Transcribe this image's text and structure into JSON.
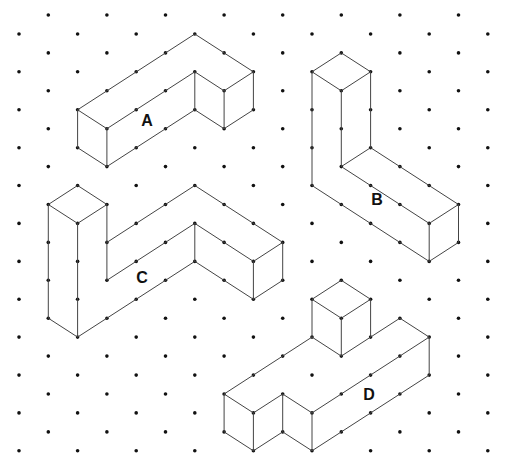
{
  "grid": {
    "type": "isometric-dot-grid",
    "columns": 17,
    "half_rows": 24,
    "origin_x": 19,
    "origin_y": 15,
    "col_spacing": 29.3,
    "half_row_spacing": 18.95,
    "dot_color": "#111111",
    "line_color": "#444444"
  },
  "shapes": [
    {
      "id": "A",
      "label": "A",
      "label_pos": [
        147,
        121
      ],
      "vertices_note": "lattice coords [col, halfrow]",
      "edges": [
        [
          [
            2,
            5
          ],
          [
            3,
            6
          ]
        ],
        [
          [
            3,
            6
          ],
          [
            3,
            8
          ]
        ],
        [
          [
            3,
            8
          ],
          [
            2,
            7
          ]
        ],
        [
          [
            2,
            7
          ],
          [
            2,
            5
          ]
        ],
        [
          [
            2,
            5
          ],
          [
            6,
            1
          ]
        ],
        [
          [
            6,
            1
          ],
          [
            8,
            3
          ]
        ],
        [
          [
            3,
            6
          ],
          [
            6,
            3
          ]
        ],
        [
          [
            3,
            8
          ],
          [
            6,
            5
          ]
        ],
        [
          [
            6,
            3
          ],
          [
            6,
            5
          ]
        ],
        [
          [
            6,
            3
          ],
          [
            7,
            4
          ]
        ],
        [
          [
            6,
            5
          ],
          [
            7,
            6
          ]
        ],
        [
          [
            7,
            4
          ],
          [
            8,
            3
          ]
        ],
        [
          [
            7,
            4
          ],
          [
            7,
            6
          ]
        ],
        [
          [
            8,
            3
          ],
          [
            8,
            5
          ]
        ],
        [
          [
            8,
            5
          ],
          [
            7,
            6
          ]
        ]
      ]
    },
    {
      "id": "B",
      "label": "B",
      "label_pos": [
        377,
        200
      ],
      "edges": [
        [
          [
            10,
            3
          ],
          [
            11,
            2
          ]
        ],
        [
          [
            11,
            2
          ],
          [
            12,
            3
          ]
        ],
        [
          [
            12,
            3
          ],
          [
            11,
            4
          ]
        ],
        [
          [
            11,
            4
          ],
          [
            10,
            3
          ]
        ],
        [
          [
            10,
            3
          ],
          [
            10,
            9
          ]
        ],
        [
          [
            11,
            4
          ],
          [
            11,
            8
          ]
        ],
        [
          [
            12,
            3
          ],
          [
            12,
            7
          ]
        ],
        [
          [
            12,
            7
          ],
          [
            15,
            10
          ]
        ],
        [
          [
            11,
            8
          ],
          [
            14,
            11
          ]
        ],
        [
          [
            10,
            9
          ],
          [
            14,
            13
          ]
        ],
        [
          [
            11,
            8
          ],
          [
            12,
            7
          ]
        ],
        [
          [
            15,
            10
          ],
          [
            14,
            11
          ]
        ],
        [
          [
            14,
            11
          ],
          [
            14,
            13
          ]
        ],
        [
          [
            15,
            10
          ],
          [
            15,
            12
          ]
        ],
        [
          [
            15,
            12
          ],
          [
            14,
            13
          ]
        ]
      ]
    },
    {
      "id": "C",
      "label": "C",
      "label_pos": [
        142,
        278
      ],
      "edges": [
        [
          [
            1,
            10
          ],
          [
            2,
            9
          ]
        ],
        [
          [
            2,
            9
          ],
          [
            3,
            10
          ]
        ],
        [
          [
            3,
            10
          ],
          [
            2,
            11
          ]
        ],
        [
          [
            2,
            11
          ],
          [
            1,
            10
          ]
        ],
        [
          [
            1,
            10
          ],
          [
            1,
            16
          ]
        ],
        [
          [
            2,
            11
          ],
          [
            2,
            17
          ]
        ],
        [
          [
            3,
            10
          ],
          [
            3,
            14
          ]
        ],
        [
          [
            1,
            16
          ],
          [
            2,
            17
          ]
        ],
        [
          [
            3,
            12
          ],
          [
            6,
            9
          ]
        ],
        [
          [
            6,
            9
          ],
          [
            9,
            12
          ]
        ],
        [
          [
            9,
            12
          ],
          [
            9,
            14
          ]
        ],
        [
          [
            9,
            14
          ],
          [
            8,
            15
          ]
        ],
        [
          [
            3,
            14
          ],
          [
            6,
            11
          ]
        ],
        [
          [
            6,
            11
          ],
          [
            8,
            13
          ]
        ],
        [
          [
            8,
            13
          ],
          [
            9,
            12
          ]
        ],
        [
          [
            8,
            13
          ],
          [
            8,
            15
          ]
        ],
        [
          [
            6,
            11
          ],
          [
            6,
            13
          ]
        ],
        [
          [
            6,
            13
          ],
          [
            8,
            15
          ]
        ],
        [
          [
            2,
            17
          ],
          [
            6,
            13
          ]
        ]
      ]
    },
    {
      "id": "D",
      "label": "D",
      "label_pos": [
        369,
        395
      ],
      "edges": [
        [
          [
            10,
            15
          ],
          [
            11,
            14
          ]
        ],
        [
          [
            11,
            14
          ],
          [
            12,
            15
          ]
        ],
        [
          [
            12,
            15
          ],
          [
            11,
            16
          ]
        ],
        [
          [
            11,
            16
          ],
          [
            10,
            15
          ]
        ],
        [
          [
            10,
            15
          ],
          [
            10,
            17
          ]
        ],
        [
          [
            11,
            16
          ],
          [
            11,
            18
          ]
        ],
        [
          [
            12,
            15
          ],
          [
            12,
            17
          ]
        ],
        [
          [
            10,
            17
          ],
          [
            11,
            18
          ]
        ],
        [
          [
            11,
            18
          ],
          [
            12,
            17
          ]
        ],
        [
          [
            12,
            17
          ],
          [
            13,
            16
          ]
        ],
        [
          [
            13,
            16
          ],
          [
            14,
            17
          ]
        ],
        [
          [
            14,
            17
          ],
          [
            14,
            19
          ]
        ],
        [
          [
            14,
            19
          ],
          [
            10,
            23
          ]
        ],
        [
          [
            10,
            17
          ],
          [
            7,
            20
          ]
        ],
        [
          [
            7,
            20
          ],
          [
            8,
            21
          ]
        ],
        [
          [
            8,
            21
          ],
          [
            9,
            20
          ]
        ],
        [
          [
            9,
            20
          ],
          [
            10,
            21
          ]
        ],
        [
          [
            10,
            21
          ],
          [
            14,
            17
          ]
        ],
        [
          [
            7,
            20
          ],
          [
            7,
            22
          ]
        ],
        [
          [
            8,
            21
          ],
          [
            8,
            23
          ]
        ],
        [
          [
            9,
            20
          ],
          [
            9,
            22
          ]
        ],
        [
          [
            10,
            21
          ],
          [
            10,
            23
          ]
        ],
        [
          [
            7,
            22
          ],
          [
            8,
            23
          ]
        ],
        [
          [
            8,
            23
          ],
          [
            9,
            22
          ]
        ],
        [
          [
            9,
            22
          ],
          [
            10,
            23
          ]
        ]
      ]
    }
  ],
  "labels": {
    "a": "A",
    "b": "B",
    "c": "C",
    "d": "D"
  },
  "cutoff_caption": "· · · · · · · · ·"
}
